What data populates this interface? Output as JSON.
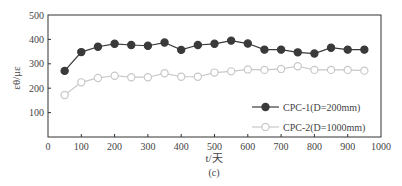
{
  "chart_data": {
    "type": "line",
    "title": "",
    "caption": "(c)",
    "xlabel": "t/天",
    "ylabel": "εθ/με",
    "xlim": [
      0,
      1000
    ],
    "ylim": [
      0,
      500
    ],
    "xticks": [
      0,
      100,
      200,
      300,
      400,
      500,
      600,
      700,
      800,
      900,
      1000
    ],
    "yticks": [
      100,
      200,
      300,
      400,
      500
    ],
    "grid": false,
    "legend_position": "bottom-right",
    "x": [
      50,
      100,
      150,
      200,
      250,
      300,
      350,
      400,
      450,
      500,
      550,
      600,
      650,
      700,
      750,
      800,
      850,
      900,
      950
    ],
    "series": [
      {
        "name": "CPC-1(D=200mm)",
        "marker": "filled-circle",
        "color": "#3a3a3a",
        "values": [
          271,
          348,
          370,
          382,
          377,
          374,
          387,
          357,
          377,
          382,
          395,
          383,
          358,
          358,
          347,
          342,
          366,
          358,
          358
        ]
      },
      {
        "name": "CPC-2(D=1000mm)",
        "marker": "open-circle",
        "color": "#c8c8c8",
        "values": [
          172,
          224,
          242,
          251,
          245,
          245,
          261,
          247,
          247,
          264,
          269,
          277,
          275,
          279,
          290,
          275,
          275,
          275,
          272
        ]
      }
    ]
  }
}
